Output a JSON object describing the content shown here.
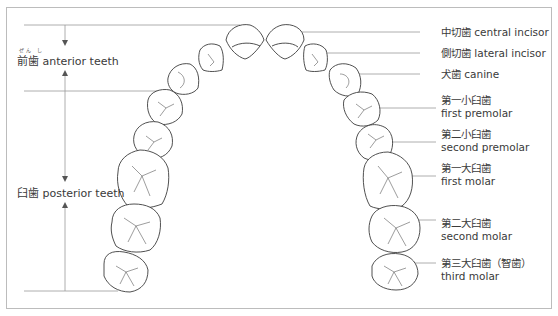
{
  "diagram": {
    "colors": {
      "line": "#9a9a9a",
      "outline": "#3c3c3c",
      "text": "#3a3a3a",
      "frame": "#bcbcbc"
    },
    "groups": [
      {
        "id": "anterior",
        "ruby": "ぜん し",
        "jp": "前歯",
        "en": "anterior teeth"
      },
      {
        "id": "posterior",
        "jp": "臼歯",
        "en": "posterior teeth"
      }
    ],
    "teeth": [
      {
        "id": "central-incisor",
        "jp": "中切歯",
        "en": "central incisor"
      },
      {
        "id": "lateral-incisor",
        "jp": "側切歯",
        "en": "lateral incisor"
      },
      {
        "id": "canine",
        "jp": "犬歯",
        "en": "canine"
      },
      {
        "id": "first-premolar",
        "jp": "第一小臼歯",
        "en": "first premolar"
      },
      {
        "id": "second-premolar",
        "jp": "第二小臼歯",
        "en": "second premolar"
      },
      {
        "id": "first-molar",
        "jp": "第一大臼歯",
        "en": "first molar"
      },
      {
        "id": "second-molar",
        "jp": "第二大臼歯",
        "en": "second molar"
      },
      {
        "id": "third-molar",
        "jp": "第三大臼歯（智歯）",
        "en": "third molar"
      }
    ]
  }
}
